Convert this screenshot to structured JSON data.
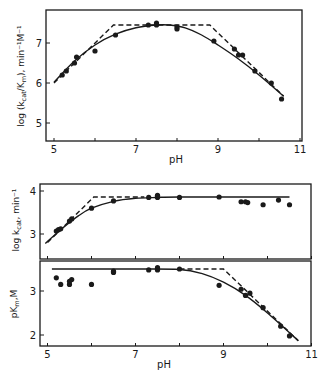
{
  "chart_data": [
    {
      "type": "scatter",
      "title": "",
      "xlabel": "pH",
      "ylabel": "log (kcat/Km), min⁻¹M⁻¹",
      "xlim": [
        4.8,
        11
      ],
      "ylim": [
        4.6,
        7.8
      ],
      "xticks": [
        5,
        6,
        7,
        8,
        9,
        10,
        11
      ],
      "xtick_labels": [
        "5",
        "",
        "7",
        "",
        "9",
        "",
        "11"
      ],
      "yticks": [
        5,
        6,
        7
      ],
      "ytick_labels": [
        "5",
        "6",
        "7"
      ],
      "grid": false,
      "points": {
        "x": [
          5.2,
          5.3,
          5.5,
          5.55,
          6.0,
          6.5,
          7.3,
          7.5,
          7.5,
          8.0,
          8.0,
          8.9,
          9.4,
          9.5,
          9.6,
          9.9,
          10.3,
          10.55
        ],
        "y": [
          6.2,
          6.3,
          6.5,
          6.65,
          6.8,
          7.2,
          7.45,
          7.45,
          7.5,
          7.35,
          7.4,
          7.05,
          6.85,
          6.7,
          6.7,
          6.3,
          6.0,
          5.6
        ]
      },
      "series": [
        {
          "name": "fitted curve",
          "style": "solid",
          "x": [
            5.0,
            5.5,
            6.0,
            6.5,
            7.0,
            7.5,
            7.8,
            8.2,
            8.6,
            9.0,
            9.5,
            10.0,
            10.6
          ],
          "y": [
            6.02,
            6.55,
            6.95,
            7.22,
            7.38,
            7.45,
            7.45,
            7.38,
            7.2,
            6.95,
            6.6,
            6.2,
            5.67
          ]
        },
        {
          "name": "asymptotes",
          "style": "dashed",
          "x": [
            5.0,
            6.45,
            8.8,
            10.6
          ],
          "y": [
            6.0,
            7.45,
            7.45,
            5.67
          ]
        }
      ]
    },
    {
      "type": "scatter",
      "title": "",
      "xlabel": "",
      "ylabel": "log kcat, min⁻¹",
      "xlim": [
        4.8,
        11
      ],
      "ylim": [
        2.45,
        4.15
      ],
      "xticks": [
        5,
        6,
        7,
        8,
        9,
        10,
        11
      ],
      "yticks": [
        3,
        4
      ],
      "ytick_labels": [
        "3",
        "4"
      ],
      "grid": false,
      "points": {
        "x": [
          5.2,
          5.25,
          5.3,
          5.5,
          5.55,
          6.0,
          6.5,
          7.3,
          7.5,
          7.5,
          7.5,
          8.0,
          8.9,
          9.4,
          9.5,
          9.55,
          9.9,
          10.25,
          10.5
        ],
        "y": [
          3.07,
          3.1,
          3.12,
          3.3,
          3.35,
          3.6,
          3.77,
          3.85,
          3.85,
          3.88,
          3.9,
          3.85,
          3.86,
          3.75,
          3.75,
          3.73,
          3.68,
          3.79,
          3.68
        ]
      },
      "series": [
        {
          "name": "fitted curve",
          "style": "solid",
          "x": [
            4.95,
            5.3,
            5.7,
            6.0,
            6.5,
            7.0,
            7.5,
            8.0,
            10.5
          ],
          "y": [
            2.78,
            3.1,
            3.42,
            3.6,
            3.76,
            3.83,
            3.85,
            3.86,
            3.86
          ]
        },
        {
          "name": "asymptotes",
          "style": "dashed",
          "x": [
            5.0,
            6.05,
            7.2
          ],
          "y": [
            2.8,
            3.86,
            3.86
          ]
        }
      ]
    },
    {
      "type": "scatter",
      "title": "",
      "xlabel": "pH",
      "ylabel": "pKm, M",
      "xlim": [
        4.8,
        11
      ],
      "ylim": [
        1.75,
        3.7
      ],
      "xticks": [
        5,
        6,
        7,
        8,
        9,
        10,
        11
      ],
      "xtick_labels": [
        "5",
        "",
        "7",
        "",
        "9",
        "",
        "11"
      ],
      "yticks": [
        2,
        3
      ],
      "ytick_labels": [
        "2",
        "3"
      ],
      "grid": false,
      "points": {
        "x": [
          5.2,
          5.3,
          5.5,
          5.5,
          5.55,
          6.0,
          6.5,
          6.5,
          7.3,
          7.5,
          7.5,
          7.5,
          8.0,
          8.9,
          9.4,
          9.5,
          9.6,
          9.9,
          10.3,
          10.5
        ],
        "y": [
          3.3,
          3.15,
          3.15,
          3.22,
          3.26,
          3.15,
          3.42,
          3.45,
          3.48,
          3.48,
          3.5,
          3.53,
          3.5,
          3.13,
          3.04,
          2.9,
          2.95,
          2.62,
          2.2,
          1.98
        ]
      },
      "series": [
        {
          "name": "fitted curve",
          "style": "solid",
          "x": [
            5.1,
            6.0,
            7.0,
            8.0,
            8.5,
            9.0,
            9.5,
            10.0,
            10.7
          ],
          "y": [
            3.5,
            3.5,
            3.5,
            3.49,
            3.4,
            3.2,
            2.9,
            2.5,
            1.87
          ]
        },
        {
          "name": "asymptotes",
          "style": "dashed",
          "x": [
            8.0,
            9.0,
            10.7
          ],
          "y": [
            3.5,
            3.5,
            1.87
          ]
        }
      ]
    }
  ],
  "figure": {
    "panels": [
      {
        "ylabel_main": "log (k",
        "ylabel_sub": "cat",
        "ylabel_mid": "/K",
        "ylabel_sub2": "m",
        "ylabel_tail": "), min⁻¹M⁻¹",
        "xlabel": "pH"
      },
      {
        "ylabel_main": "log k",
        "ylabel_sub": "cat",
        "ylabel_tail": ", min⁻¹"
      },
      {
        "ylabel_main": "pK",
        "ylabel_sub": "m",
        "ylabel_tail": ",M",
        "xlabel": "pH"
      }
    ],
    "ink_color": "#1a1a1a"
  }
}
